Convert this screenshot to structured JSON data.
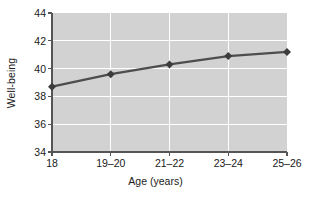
{
  "chart_data": {
    "type": "line",
    "title": "",
    "xlabel": "Age (years)",
    "ylabel": "Well-being",
    "categories": [
      "18",
      "19–20",
      "21–22",
      "23–24",
      "25–26"
    ],
    "values": [
      38.7,
      39.6,
      40.3,
      40.9,
      41.2
    ],
    "series": [
      {
        "name": "Well-being",
        "values": [
          38.7,
          39.6,
          40.3,
          40.9,
          41.2
        ]
      }
    ],
    "ylim": [
      34,
      44
    ],
    "yticks": [
      34,
      36,
      38,
      40,
      42,
      44
    ],
    "ytick_labels": [
      "34",
      "36",
      "38",
      "40",
      "42",
      "44"
    ],
    "xtick_labels": [
      "18",
      "19–20",
      "21–22",
      "23–24",
      "25–26"
    ],
    "grid": true,
    "grid_axis": "both",
    "legend": false,
    "legend_position": "none",
    "marker": "diamond",
    "colors": {
      "line": "#4d4d4d",
      "marker": "#3c3c3c",
      "plot_background": "#d2d2d2",
      "gridline": "#ffffff",
      "axis": "#555555",
      "text": "#1a1a1a",
      "figure_background": "#ffffff"
    }
  }
}
